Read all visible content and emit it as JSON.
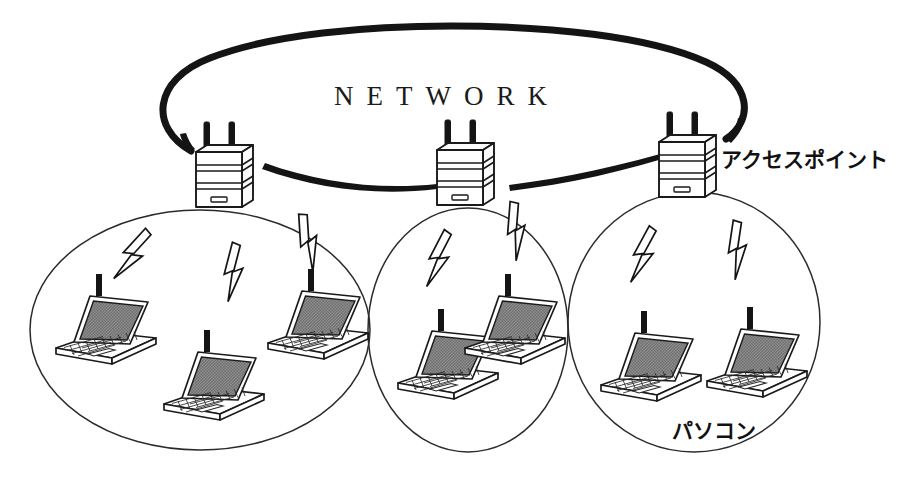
{
  "diagram": {
    "kind": "wireless-lan-network-diagram",
    "background_color": "#ffffff",
    "ink_color": "#141414",
    "screen_fill_color": "#8a8a8a",
    "network_cloud": {
      "label": "NETWORK",
      "shape": "open-oval",
      "label_color": "#1a1a1a"
    },
    "labels": {
      "access_point": "アクセスポイント",
      "personal_computer": "パソコン"
    },
    "access_points": [
      {
        "id": "ap-left",
        "label": "アクセスポイント",
        "x": 215,
        "y": 150,
        "antennas": 2
      },
      {
        "id": "ap-middle",
        "label": "アクセスポイント",
        "x": 460,
        "y": 150,
        "antennas": 2
      },
      {
        "id": "ap-right",
        "label": "アクセスポイント",
        "x": 685,
        "y": 150,
        "antennas": 2
      }
    ],
    "coverage_cells": [
      {
        "id": "cell-left",
        "cx": 200,
        "cy": 330,
        "rx": 170,
        "ry": 120,
        "clients": 3
      },
      {
        "id": "cell-middle",
        "cx": 468,
        "cy": 330,
        "rx": 100,
        "ry": 122,
        "clients": 2
      },
      {
        "id": "cell-right",
        "cx": 694,
        "cy": 322,
        "rx": 126,
        "ry": 130,
        "clients": 2
      }
    ],
    "clients": [
      {
        "id": "pc-1",
        "cell": "cell-left",
        "label": "パソコン"
      },
      {
        "id": "pc-2",
        "cell": "cell-left",
        "label": "パソコン"
      },
      {
        "id": "pc-3",
        "cell": "cell-left",
        "label": "パソコン"
      },
      {
        "id": "pc-4",
        "cell": "cell-middle",
        "label": "パソコン"
      },
      {
        "id": "pc-5",
        "cell": "cell-middle",
        "label": "パソコン"
      },
      {
        "id": "pc-6",
        "cell": "cell-right",
        "label": "パソコン"
      },
      {
        "id": "pc-7",
        "cell": "cell-right",
        "label": "パソコン"
      }
    ],
    "wireless_links": 7,
    "backbone_links": 2
  }
}
